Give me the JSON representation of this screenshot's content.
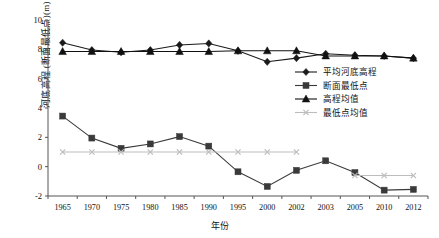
{
  "chart_data": {
    "type": "line",
    "title": "",
    "xlabel": "年份",
    "ylabel": "河底高程 (断面最低点)(m)",
    "categories": [
      "1965",
      "1970",
      "1975",
      "1980",
      "1985",
      "1990",
      "1995",
      "2000",
      "2002",
      "2003",
      "2005",
      "2010",
      "2012"
    ],
    "ylim": [
      -2,
      10
    ],
    "yticks": [
      -2,
      0,
      2,
      4,
      6,
      8,
      10
    ],
    "ytick_labels": [
      "-2",
      "0",
      "2",
      "4",
      "6",
      "8",
      "10"
    ],
    "grid": false,
    "legend_position": "center-right",
    "series": [
      {
        "name": "平均河底高程",
        "marker": "diamond",
        "color": "#1a1a1a",
        "values": [
          8.45,
          7.95,
          7.8,
          7.95,
          8.3,
          8.4,
          7.9,
          7.15,
          7.4,
          7.7,
          7.6,
          7.55,
          7.4
        ]
      },
      {
        "name": "断面最低点",
        "marker": "square",
        "color": "#3a3a3a",
        "values": [
          3.45,
          1.95,
          1.25,
          1.55,
          2.05,
          1.4,
          -0.35,
          -1.35,
          -0.25,
          0.4,
          -0.4,
          -1.6,
          -1.55
        ]
      },
      {
        "name": "高程均值",
        "marker": "triangle",
        "color": "#111111",
        "values": [
          7.85,
          7.85,
          7.85,
          7.85,
          7.85,
          7.85,
          7.9,
          7.9,
          7.9,
          7.55,
          7.55,
          7.55,
          7.4
        ]
      },
      {
        "name": "最低点均值",
        "marker": "cross",
        "color": "#bdbdbd",
        "values": [
          1.0,
          1.0,
          1.0,
          1.0,
          1.0,
          1.0,
          1.0,
          1.0,
          1.0,
          null,
          -0.6,
          -0.6,
          -0.6
        ]
      }
    ]
  },
  "legend": {
    "items": [
      {
        "label": "平均河底高程",
        "marker": "diamond",
        "color": "#1a1a1a"
      },
      {
        "label": "断面最低点",
        "marker": "square",
        "color": "#3a3a3a"
      },
      {
        "label": "高程均值",
        "marker": "triangle",
        "color": "#111111"
      },
      {
        "label": "最低点均值",
        "marker": "cross",
        "color": "#bdbdbd"
      }
    ]
  }
}
